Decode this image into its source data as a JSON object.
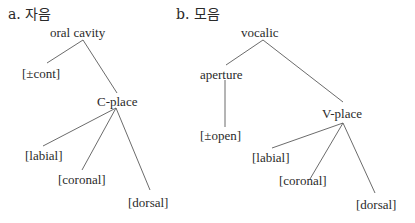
{
  "diagrams": [
    {
      "heading": "a. 자음",
      "root": "oral cavity",
      "nodes": {
        "cont": "[±cont]",
        "place": "C-place",
        "labial": "[labial]",
        "coronal": "[coronal]",
        "dorsal": "[dorsal]"
      }
    },
    {
      "heading": "b. 모음",
      "root": "vocalic",
      "nodes": {
        "aperture": "aperture",
        "open": "[±open]",
        "place": "V-place",
        "labial": "[labial]",
        "coronal": "[coronal]",
        "dorsal": "[dorsal]"
      }
    }
  ]
}
